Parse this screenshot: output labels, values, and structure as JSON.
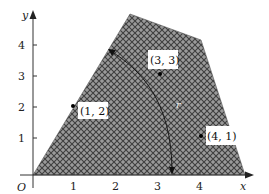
{
  "diagram": {
    "type": "shaded-region-plot",
    "axes": {
      "x_label": "x",
      "y_label": "y",
      "origin_label": "O",
      "x_ticks": [
        "1",
        "2",
        "3",
        "4"
      ],
      "y_ticks": [
        "1",
        "2",
        "3",
        "4"
      ]
    },
    "region": {
      "fill_pattern": "crosshatch",
      "fill_color": "#8a8a8a",
      "hatch_color": "#3a3a3a"
    },
    "points": [
      {
        "label": "(1, 2)",
        "x": 1,
        "y": 2
      },
      {
        "label": "(3, 3)",
        "x": 3,
        "y": 3
      },
      {
        "label": "(4, 1)",
        "x": 4,
        "y": 1
      }
    ],
    "curve_label": "r"
  }
}
